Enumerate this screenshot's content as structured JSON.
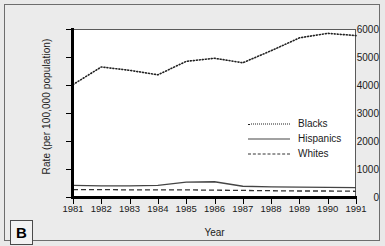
{
  "panel": {
    "letter": "B"
  },
  "chart_data": {
    "type": "line",
    "title": "",
    "xlabel": "Year",
    "ylabel": "Rate (per 100,000 population)",
    "categories": [
      "1981",
      "1982",
      "1983",
      "1984",
      "1985",
      "1986",
      "1987",
      "1988",
      "1989",
      "1990",
      "1991"
    ],
    "x": [
      1981,
      1982,
      1983,
      1984,
      1985,
      1986,
      1987,
      1988,
      1989,
      1990,
      1991
    ],
    "xlim": [
      1981,
      1991
    ],
    "ylim": [
      0,
      6000
    ],
    "yticks": [
      0,
      1000,
      2000,
      3000,
      4000,
      5000,
      6000
    ],
    "ytick_labels": [
      "0",
      "1000",
      "2000",
      "3000",
      "4000",
      "5000",
      "6000"
    ],
    "grid": false,
    "legend_position": "center-right",
    "series": [
      {
        "name": "Blacks",
        "style": "dotted",
        "color": "#222222",
        "values": [
          4050,
          4680,
          4560,
          4400,
          4880,
          4990,
          4830,
          5260,
          5720,
          5880,
          5800
        ]
      },
      {
        "name": "Hispanics",
        "style": "solid",
        "color": "#444444",
        "values": [
          450,
          430,
          430,
          450,
          570,
          580,
          420,
          400,
          390,
          380,
          370
        ]
      },
      {
        "name": "Whites",
        "style": "dashed",
        "color": "#333333",
        "values": [
          300,
          300,
          290,
          290,
          290,
          280,
          270,
          260,
          250,
          250,
          240
        ]
      }
    ]
  },
  "legend": {
    "items": [
      {
        "label": "Blacks",
        "style": "dotted"
      },
      {
        "label": "Hispanics",
        "style": "solid"
      },
      {
        "label": "Whites",
        "style": "dashed"
      }
    ]
  }
}
